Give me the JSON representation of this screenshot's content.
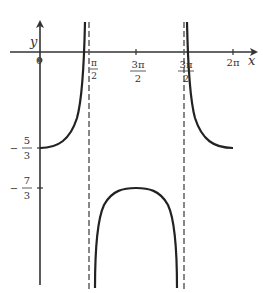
{
  "figure": {
    "type": "function-graph",
    "axes": {
      "x_label": "x",
      "y_label": "y",
      "origin_label": "0"
    },
    "x_ticks": [
      {
        "num": "π",
        "den": "2",
        "value": "pi/2"
      },
      {
        "num": "3π",
        "den": "2",
        "value": "pi"
      },
      {
        "num": "3π",
        "den": "2",
        "value": "3pi/2"
      },
      {
        "text": "2π",
        "value": "2pi"
      }
    ],
    "y_ticks": [
      {
        "sign": "−",
        "num": "5",
        "den": "3",
        "value": "-5/3"
      },
      {
        "sign": "−",
        "num": "7",
        "den": "3",
        "value": "-7/3"
      }
    ],
    "asymptotes": [
      "x = π/2",
      "x = 3π/2"
    ],
    "curve_branches": [
      {
        "domain": "[0, π/2)",
        "start_value": "-5/3",
        "behavior": "increases to +∞"
      },
      {
        "domain": "(π/2, 3π/2)",
        "max_value": "-7/3",
        "max_at": "π",
        "behavior": "inverted U to −∞ at both asymptotes"
      },
      {
        "domain": "(3π/2, 2π]",
        "end_value": "-5/3",
        "behavior": "decreases from +∞"
      }
    ],
    "colors": {
      "curve": "#222222",
      "axis": "#333333",
      "asymptote": "#555555"
    }
  }
}
